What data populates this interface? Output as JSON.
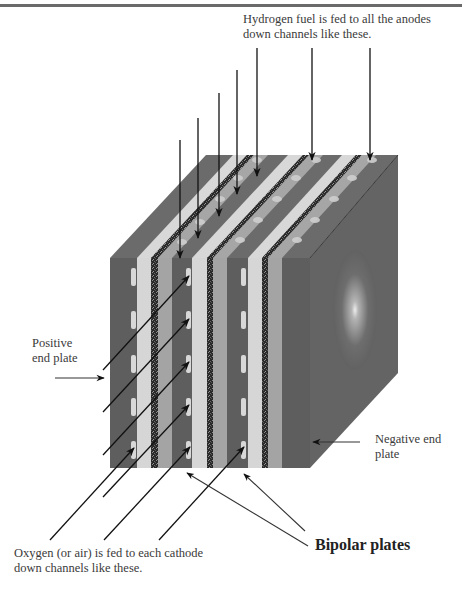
{
  "figure": {
    "labels": {
      "hydrogen": [
        "Hydrogen fuel is fed to all the anodes",
        "down channels like these."
      ],
      "positive": [
        "Positive",
        "end plate"
      ],
      "negative": [
        "Negative end",
        "plate"
      ],
      "oxygen": [
        "Oxygen (or air) is fed to each cathode",
        "down channels like these."
      ],
      "bipolar": "Bipolar plates"
    },
    "colors": {
      "end_plate": "#5e5e5e",
      "bipolar_light": "#d6d6d6",
      "bipolar_mid": "#a4a4a4",
      "electrode": "#2a2a2a",
      "side_face": "#666666",
      "top_face": "#6b6b6b"
    }
  }
}
